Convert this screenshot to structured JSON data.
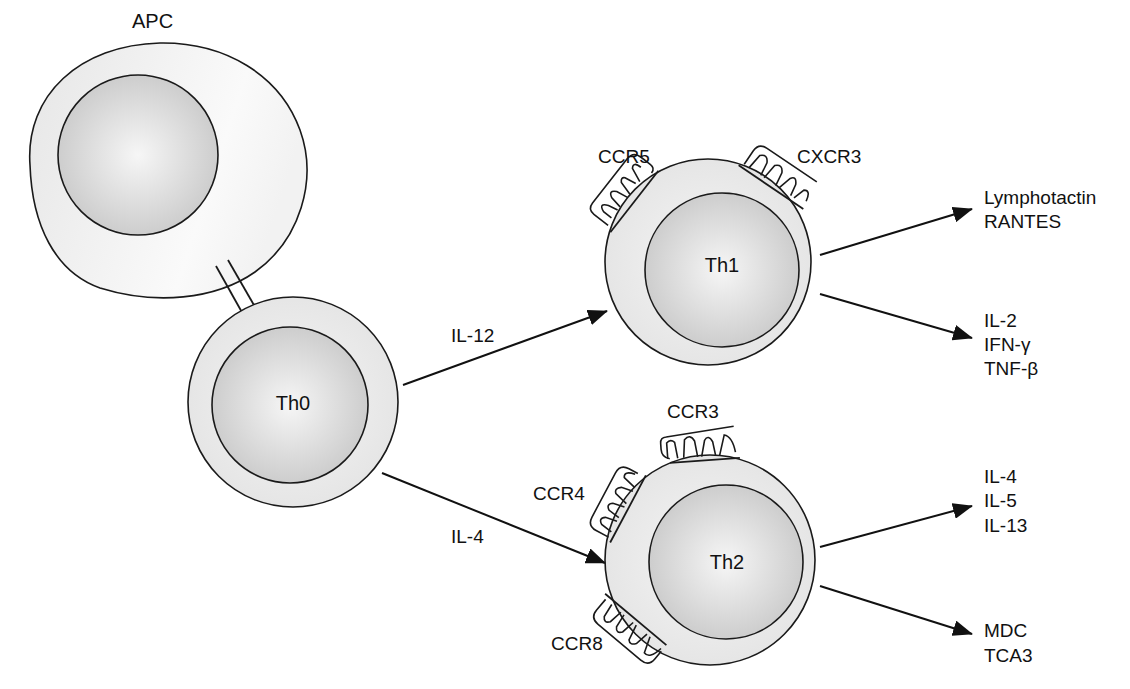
{
  "cells": {
    "apc": {
      "label": "APC"
    },
    "th0": {
      "label": "Th0"
    },
    "th1": {
      "label": "Th1"
    },
    "th2": {
      "label": "Th2"
    }
  },
  "receptors": {
    "ccr5": "CCR5",
    "cxcr3": "CXCR3",
    "ccr3": "CCR3",
    "ccr4": "CCR4",
    "ccr8": "CCR8"
  },
  "arrows": {
    "th0_to_th1": "IL-12",
    "th0_to_th2": "IL-4"
  },
  "outputs": {
    "th1_chemokines": [
      "Lymphotactin",
      "RANTES"
    ],
    "th1_cytokines": [
      "IL-2",
      "IFN-γ",
      "TNF-β"
    ],
    "th2_cytokines": [
      "IL-4",
      "IL-5",
      "IL-13"
    ],
    "th2_chemokines": [
      "MDC",
      "TCA3"
    ]
  },
  "colors": {
    "stroke": "#1a1a1a",
    "cytoplasm": "#ececec",
    "nucleus_center": "#f4f4f4",
    "nucleus_edge": "#c8c8c8"
  }
}
